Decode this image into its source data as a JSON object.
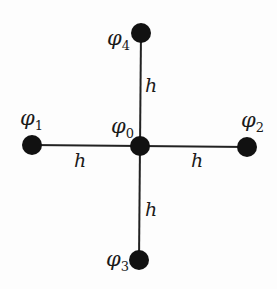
{
  "diagram": {
    "type": "five-point finite difference stencil",
    "colors": {
      "node": "#111111",
      "edge": "#222222",
      "text": "#1a1a1a",
      "background": "#fdfdfd"
    },
    "nodes": [
      {
        "id": "phi0",
        "symbol": "φ",
        "subscript": "0",
        "position": "center"
      },
      {
        "id": "phi1",
        "symbol": "φ",
        "subscript": "1",
        "position": "left"
      },
      {
        "id": "phi2",
        "symbol": "φ",
        "subscript": "2",
        "position": "right"
      },
      {
        "id": "phi3",
        "symbol": "φ",
        "subscript": "3",
        "position": "bottom"
      },
      {
        "id": "phi4",
        "symbol": "φ",
        "subscript": "4",
        "position": "top"
      }
    ],
    "edges": [
      {
        "from": "phi0",
        "to": "phi1",
        "label": "h"
      },
      {
        "from": "phi0",
        "to": "phi2",
        "label": "h"
      },
      {
        "from": "phi0",
        "to": "phi3",
        "label": "h"
      },
      {
        "from": "phi0",
        "to": "phi4",
        "label": "h"
      }
    ]
  }
}
